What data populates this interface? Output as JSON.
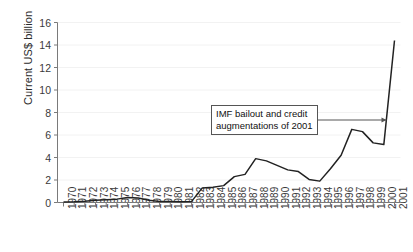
{
  "chart_data": {
    "type": "line",
    "title": "",
    "xlabel": "",
    "ylabel": "Current US$ billion",
    "ylim": [
      0,
      16
    ],
    "yticks": [
      0,
      2,
      4,
      6,
      8,
      10,
      12,
      14,
      16
    ],
    "grid": "faint horizontal gridlines",
    "legend": "none",
    "x": [
      1970,
      1971,
      1972,
      1973,
      1974,
      1975,
      1976,
      1977,
      1978,
      1979,
      1980,
      1981,
      1982,
      1983,
      1984,
      1985,
      1986,
      1987,
      1988,
      1989,
      1990,
      1991,
      1992,
      1993,
      1994,
      1995,
      1996,
      1997,
      1998,
      1999,
      2000,
      2001
    ],
    "categories": [
      "1970",
      "1971",
      "1972",
      "1973",
      "1974",
      "1975",
      "1976",
      "1977",
      "1978",
      "1979",
      "1980",
      "1981",
      "1982",
      "1983",
      "1984",
      "1985",
      "1986",
      "1987",
      "1988",
      "1989",
      "1990",
      "1991",
      "1992",
      "1993",
      "1994",
      "1995",
      "1996",
      "1997",
      "1998",
      "1999",
      "2000",
      "2001"
    ],
    "values": [
      0.05,
      0.07,
      0.12,
      0.2,
      0.25,
      0.3,
      0.45,
      0.4,
      0.2,
      0.1,
      0.08,
      0.07,
      0.1,
      1.3,
      1.35,
      1.5,
      2.3,
      2.5,
      3.9,
      3.7,
      3.3,
      2.9,
      2.75,
      2.05,
      1.9,
      3.0,
      4.2,
      6.5,
      6.3,
      5.3,
      5.15,
      14.4
    ],
    "annotations": [
      {
        "text_line1": "IMF bailout and credit",
        "text_line2": "augmentations of 2001",
        "points_to_year": 2001,
        "arrow_direction": "right"
      }
    ],
    "series_color": "#222222",
    "axis_color": "#7a7a7a"
  },
  "colors": {
    "line": "#222222",
    "axis": "#7a7a7a",
    "grid": "#f2f2f2",
    "text": "#333333",
    "annotation_border": "#555555"
  }
}
